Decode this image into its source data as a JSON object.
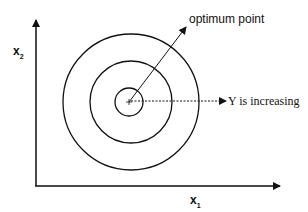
{
  "diagram": {
    "axes": {
      "x_label": "x",
      "x_sub": "1",
      "y_label": "x",
      "y_sub": "2"
    },
    "annotations": {
      "optimum": "optimum point",
      "increasing": "Y is increasing"
    },
    "contours": {
      "count": 3,
      "center": [
        129,
        102
      ],
      "radii": [
        14,
        41,
        68
      ]
    },
    "colors": {
      "line": "#111111",
      "background": "#ffffff"
    }
  }
}
